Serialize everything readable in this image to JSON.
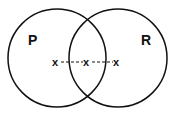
{
  "diagram": {
    "type": "venn",
    "sets": [
      {
        "label": "P",
        "cx": 57,
        "cy": 58,
        "r": 49
      },
      {
        "label": "R",
        "cx": 118,
        "cy": 58,
        "r": 49
      }
    ],
    "points": [
      {
        "label": "x",
        "x": 56,
        "y": 62
      },
      {
        "label": "x",
        "x": 87,
        "y": 62
      },
      {
        "label": "x",
        "x": 117,
        "y": 62
      }
    ],
    "connector_style": "dashed",
    "stroke_color": "#111111"
  }
}
